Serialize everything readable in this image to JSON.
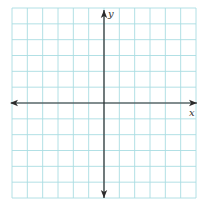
{
  "diagram": {
    "type": "coordinate-plane",
    "grid": {
      "columns": 12,
      "rows": 12,
      "left": 12,
      "top": 8,
      "right": 196,
      "bottom": 198,
      "line_color": "#a9dde2",
      "background": "#ffffff"
    },
    "axes": {
      "color": "#2b2b2b",
      "origin_col": 6,
      "origin_row": 6,
      "x_label": "x",
      "y_label": "y",
      "arrows": {
        "left": true,
        "right": true,
        "up": true,
        "down": true
      }
    }
  }
}
